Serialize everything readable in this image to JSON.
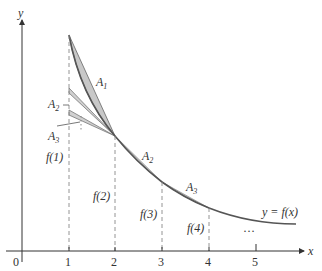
{
  "diagram": {
    "axes": {
      "x_label": "x",
      "y_label": "y",
      "origin_label": "0",
      "x_ticks": [
        "1",
        "2",
        "3",
        "4",
        "5"
      ]
    },
    "curve_label": "y = f(x)",
    "area_labels": {
      "A1": {
        "base": "A",
        "sub": "1"
      },
      "A2_left": {
        "base": "A",
        "sub": "2"
      },
      "A3_left": {
        "base": "A",
        "sub": "3"
      },
      "A2_right": {
        "base": "A",
        "sub": "2"
      },
      "A3_right": {
        "base": "A",
        "sub": "3"
      }
    },
    "height_labels": [
      "f(1)",
      "f(2)",
      "f(3)",
      "f(4)"
    ],
    "ellipsis_vertical": "⋮",
    "ellipsis_horizontal": "…",
    "colors": {
      "shade": "#c8c8c8",
      "curve": "#555555",
      "axis": "#333333",
      "dashed": "#888888"
    }
  }
}
